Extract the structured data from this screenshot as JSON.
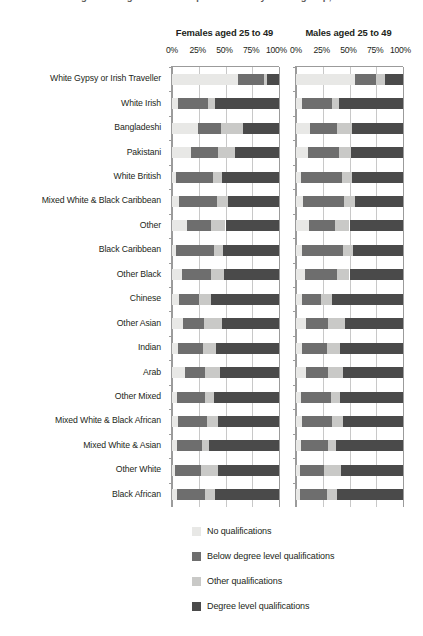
{
  "clipped_title": "Figure 3: Highest level of qualification by ethnic group, sex",
  "panels": [
    {
      "id": "females",
      "title": "Females aged 25 to 49"
    },
    {
      "id": "males",
      "title": "Males aged 25 to 49"
    }
  ],
  "axis": {
    "ticks": [
      "0%",
      "25%",
      "50%",
      "75%",
      "100%"
    ],
    "tick_values": [
      0,
      25,
      50,
      75,
      100
    ]
  },
  "legend": {
    "items": [
      {
        "label": "No qualifications",
        "color": "#e8e8e6"
      },
      {
        "label": "Below degree level qualifications",
        "color": "#6e6e6e"
      },
      {
        "label": "Other qualifications",
        "color": "#c9c9c7"
      },
      {
        "label": "Degree level qualifications",
        "color": "#4a4a4a"
      }
    ]
  },
  "chart_data": {
    "type": "bar",
    "subtype": "stacked-horizontal-100pct",
    "xlabel": "",
    "ylabel": "",
    "xlim": [
      0,
      100
    ],
    "grid": true,
    "legend_position": "bottom",
    "panels": [
      "Females aged 25 to 49",
      "Males aged 25 to 49"
    ],
    "series_names": [
      "No qualifications",
      "Below degree level qualifications",
      "Other qualifications",
      "Degree level qualifications"
    ],
    "series_colors": [
      "#e8e8e6",
      "#6e6e6e",
      "#c9c9c7",
      "#4a4a4a"
    ],
    "categories": [
      "White Gypsy or Irish Traveller",
      "White Irish",
      "Bangladeshi",
      "Pakistani",
      "White British",
      "Mixed White & Black Caribbean",
      "Other",
      "Black Caribbean",
      "Other Black",
      "Chinese",
      "Other Asian",
      "Indian",
      "Arab",
      "Other Mixed",
      "Mixed White & Black African",
      "Mixed White & Asian",
      "Other White",
      "Black African"
    ],
    "females": [
      {
        "category": "White Gypsy or Irish Traveller",
        "values": [
          62,
          24,
          3,
          11
        ]
      },
      {
        "category": "White Irish",
        "values": [
          6,
          28,
          6,
          60
        ]
      },
      {
        "category": "Bangladeshi",
        "values": [
          24,
          22,
          20,
          34
        ]
      },
      {
        "category": "Pakistani",
        "values": [
          18,
          25,
          16,
          41
        ]
      },
      {
        "category": "White British",
        "values": [
          4,
          34,
          9,
          53
        ]
      },
      {
        "category": "Mixed White & Black Caribbean",
        "values": [
          7,
          35,
          10,
          48
        ]
      },
      {
        "category": "Other",
        "values": [
          14,
          22,
          14,
          50
        ]
      },
      {
        "category": "Black Caribbean",
        "values": [
          4,
          35,
          9,
          52
        ]
      },
      {
        "category": "Other Black",
        "values": [
          9,
          27,
          13,
          51
        ]
      },
      {
        "category": "Chinese",
        "values": [
          7,
          18,
          11,
          64
        ]
      },
      {
        "category": "Other Asian",
        "values": [
          10,
          20,
          17,
          53
        ]
      },
      {
        "category": "Indian",
        "values": [
          6,
          23,
          12,
          59
        ]
      },
      {
        "category": "Arab",
        "values": [
          12,
          19,
          14,
          55
        ]
      },
      {
        "category": "Other Mixed",
        "values": [
          5,
          26,
          8,
          61
        ]
      },
      {
        "category": "Mixed White & Black African",
        "values": [
          6,
          27,
          10,
          57
        ]
      },
      {
        "category": "Mixed White & Asian",
        "values": [
          5,
          23,
          7,
          65
        ]
      },
      {
        "category": "Other White",
        "values": [
          3,
          24,
          16,
          57
        ]
      },
      {
        "category": "Black African",
        "values": [
          5,
          26,
          9,
          60
        ]
      }
    ],
    "males": [
      {
        "category": "White Gypsy or Irish Traveller",
        "values": [
          55,
          20,
          8,
          17
        ]
      },
      {
        "category": "White Irish",
        "values": [
          6,
          28,
          6,
          60
        ]
      },
      {
        "category": "Bangladeshi",
        "values": [
          13,
          25,
          14,
          48
        ]
      },
      {
        "category": "Pakistani",
        "values": [
          11,
          29,
          11,
          49
        ]
      },
      {
        "category": "White British",
        "values": [
          5,
          38,
          9,
          48
        ]
      },
      {
        "category": "Mixed White & Black Caribbean",
        "values": [
          7,
          38,
          10,
          45
        ]
      },
      {
        "category": "Other",
        "values": [
          12,
          24,
          14,
          50
        ]
      },
      {
        "category": "Black Caribbean",
        "values": [
          6,
          38,
          9,
          47
        ]
      },
      {
        "category": "Other Black",
        "values": [
          8,
          30,
          12,
          50
        ]
      },
      {
        "category": "Chinese",
        "values": [
          6,
          17,
          11,
          66
        ]
      },
      {
        "category": "Other Asian",
        "values": [
          9,
          21,
          16,
          54
        ]
      },
      {
        "category": "Indian",
        "values": [
          6,
          23,
          12,
          59
        ]
      },
      {
        "category": "Arab",
        "values": [
          9,
          21,
          14,
          56
        ]
      },
      {
        "category": "Other Mixed",
        "values": [
          5,
          28,
          8,
          59
        ]
      },
      {
        "category": "Mixed White & Black African",
        "values": [
          6,
          28,
          10,
          56
        ]
      },
      {
        "category": "Mixed White & Asian",
        "values": [
          5,
          25,
          7,
          63
        ]
      },
      {
        "category": "Other White",
        "values": [
          4,
          22,
          16,
          58
        ]
      },
      {
        "category": "Black African",
        "values": [
          4,
          25,
          9,
          62
        ]
      }
    ]
  }
}
